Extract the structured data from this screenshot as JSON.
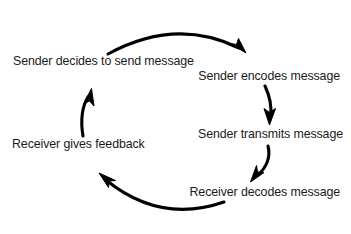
{
  "diagram": {
    "type": "cycle",
    "background_color": "#ffffff",
    "stroke_color": "#000000",
    "text_color": "#1a1a1a",
    "nodes": [
      {
        "id": "sender-decides",
        "label": "Sender decides to send message",
        "order": 1
      },
      {
        "id": "sender-encodes",
        "label": "Sender encodes message",
        "order": 2
      },
      {
        "id": "sender-transmits",
        "label": "Sender transmits message",
        "order": 3
      },
      {
        "id": "receiver-decodes",
        "label": "Receiver decodes message",
        "order": 4
      },
      {
        "id": "receiver-feedback",
        "label": "Receiver gives feedback",
        "order": 5
      }
    ],
    "edges": [
      {
        "id": "edge-1",
        "from": "sender-decides",
        "to": "sender-encodes",
        "shape": "arc-top"
      },
      {
        "id": "edge-2",
        "from": "sender-encodes",
        "to": "sender-transmits",
        "shape": "arc-right-vertical"
      },
      {
        "id": "edge-3",
        "from": "sender-transmits",
        "to": "receiver-decodes",
        "shape": "arc-diagonal-down-left"
      },
      {
        "id": "edge-4",
        "from": "receiver-decodes",
        "to": "receiver-feedback",
        "shape": "arc-bottom"
      },
      {
        "id": "edge-5",
        "from": "receiver-feedback",
        "to": "sender-decides",
        "shape": "arc-left-vertical"
      }
    ]
  }
}
